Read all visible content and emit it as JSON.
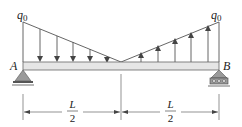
{
  "diagram": {
    "load": {
      "left_label": "q",
      "left_label_sub": "0",
      "right_label": "q",
      "right_label_sub": "0",
      "left_direction": "down",
      "right_direction": "up",
      "left_arrow_count": 5,
      "right_arrow_count": 5
    },
    "supports": {
      "left": {
        "label": "A",
        "type": "pin"
      },
      "right": {
        "label": "B",
        "type": "roller"
      }
    },
    "dimensions": [
      {
        "numerator": "L",
        "denominator": "2"
      },
      {
        "numerator": "L",
        "denominator": "2"
      }
    ],
    "colors": {
      "line": "#555555",
      "beam_fill": "#e6e6e6",
      "beam_stroke": "#666666",
      "support_fill": "#9a9a9a",
      "text": "#222222"
    }
  }
}
